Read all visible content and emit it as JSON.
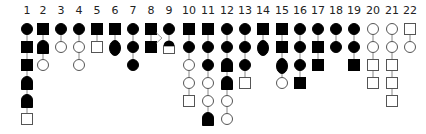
{
  "diagram": {
    "title": "",
    "colors": {
      "filled": "#000000",
      "open_stroke": "#555555",
      "line": "#888888",
      "label": "#222222"
    },
    "legend_types": {
      "C": "filled-circle",
      "S": "filled-square",
      "B": "filled-bullet (rounded top, flat bottom)",
      "E": "filled-oval",
      "H": "half-filled (filled dome on open square)",
      "c": "open-circle",
      "s": "open-square"
    },
    "columns": [
      {
        "label": "1",
        "x": 27,
        "symbols": [
          "C",
          "S",
          "S",
          "B",
          "B",
          "s"
        ]
      },
      {
        "label": "2",
        "x": 43,
        "symbols": [
          "S",
          "B",
          "c"
        ]
      },
      {
        "label": "3",
        "x": 61,
        "symbols": [
          "C",
          "c"
        ]
      },
      {
        "label": "4",
        "x": 79,
        "symbols": [
          "C",
          "c",
          "c"
        ]
      },
      {
        "label": "5",
        "x": 97,
        "symbols": [
          "S",
          "s"
        ]
      },
      {
        "label": "6",
        "x": 115,
        "symbols": [
          "S",
          "E"
        ]
      },
      {
        "label": "7",
        "x": 133,
        "symbols": [
          "C",
          "C",
          "C"
        ]
      },
      {
        "label": "8",
        "x": 151,
        "symbols": [
          "S",
          "S"
        ]
      },
      {
        "label": "9",
        "x": 169,
        "symbols": [
          "C",
          "H"
        ]
      },
      {
        "label": "10",
        "x": 189,
        "symbols": [
          "S",
          "C",
          "c",
          "c",
          "s"
        ]
      },
      {
        "label": "11",
        "x": 208,
        "symbols": [
          "S",
          "C",
          "C",
          "c",
          "c",
          "B"
        ]
      },
      {
        "label": "12",
        "x": 227,
        "symbols": [
          "C",
          "C",
          "B",
          "B",
          "c",
          "c"
        ]
      },
      {
        "label": "13",
        "x": 245,
        "symbols": [
          "C",
          "C",
          "C",
          "s"
        ]
      },
      {
        "label": "14",
        "x": 263,
        "symbols": [
          "S",
          "E"
        ]
      },
      {
        "label": "15",
        "x": 282,
        "symbols": [
          "S",
          "S",
          "E",
          "c"
        ]
      },
      {
        "label": "16",
        "x": 300,
        "symbols": [
          "C",
          "C",
          "C",
          "S"
        ]
      },
      {
        "label": "17",
        "x": 318,
        "symbols": [
          "C",
          "S",
          "S"
        ]
      },
      {
        "label": "18",
        "x": 336,
        "symbols": [
          "C",
          "C"
        ]
      },
      {
        "label": "19",
        "x": 354,
        "symbols": [
          "C",
          "C",
          "S"
        ]
      },
      {
        "label": "20",
        "x": 373,
        "symbols": [
          "c",
          "c",
          "s",
          "s"
        ]
      },
      {
        "label": "21",
        "x": 392,
        "symbols": [
          "c",
          "c",
          "s",
          "s",
          "s"
        ]
      },
      {
        "label": "22",
        "x": 410,
        "symbols": [
          "s",
          "c"
        ]
      }
    ],
    "connectors": [
      {
        "type": "chevron",
        "from_column": "8",
        "to_column": "9"
      }
    ],
    "layout": {
      "label_y": 14,
      "row0_y": 29,
      "row_step": 18,
      "size": 11
    }
  }
}
